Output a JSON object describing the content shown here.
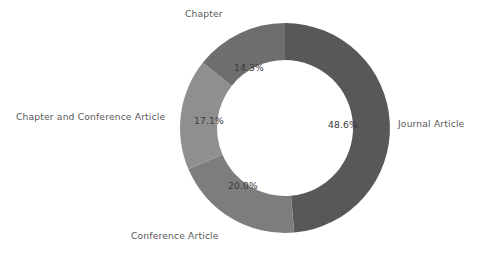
{
  "chart_data": {
    "type": "pie",
    "variant": "donut",
    "title": "",
    "xlabel": "",
    "ylabel": "",
    "legend_position": "outside-labels",
    "grid": false,
    "start_angle_deg": 0,
    "direction": "clockwise",
    "hole_ratio": 0.65,
    "categories": [
      "Journal Article",
      "Conference Article",
      "Chapter and Conference Article",
      "Chapter"
    ],
    "values": [
      48.6,
      20.0,
      17.1,
      14.3
    ],
    "value_labels": [
      "48.6%",
      "20.0%",
      "17.1%",
      "14.3%"
    ],
    "colors": [
      "#585858",
      "#7d7d7d",
      "#8f8f8f",
      "#6e6e6e"
    ],
    "slices": [
      {
        "name": "Journal Article",
        "label": "Journal Article",
        "value": 48.6,
        "percent_label": "48.6%",
        "color": "#585858",
        "start_deg": 0,
        "end_deg": 174.96
      },
      {
        "name": "Conference Article",
        "label": "Conference Article",
        "value": 20.0,
        "percent_label": "20.0%",
        "color": "#7d7d7d",
        "start_deg": 174.96,
        "end_deg": 246.96
      },
      {
        "name": "Chapter and Conference Article",
        "label": "Chapter and Conference Article",
        "value": 17.1,
        "percent_label": "17.1%",
        "color": "#8f8f8f",
        "start_deg": 246.96,
        "end_deg": 308.52
      },
      {
        "name": "Chapter",
        "label": "Chapter",
        "value": 14.3,
        "percent_label": "14.3%",
        "color": "#6e6e6e",
        "start_deg": 308.52,
        "end_deg": 360
      }
    ]
  },
  "figure": {
    "background": "#ffffff",
    "label_color": "#595959",
    "value_color": "#3a3a3a"
  }
}
